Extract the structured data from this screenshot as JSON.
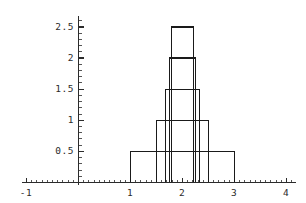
{
  "figure": {
    "background_color": "#ffffff",
    "line_color": "#1a1a1a",
    "axis_color": "#2b2b2b",
    "width": 306,
    "height": 203
  },
  "axes": {
    "x_axis_name": "x-axis",
    "y_axis_name": "y-axis",
    "x_tick_labels": [
      "-1",
      "1",
      "2",
      "3",
      "4"
    ],
    "y_tick_labels": [
      "0.5",
      "1",
      "1.5",
      "2",
      "2.5"
    ]
  },
  "chart_data": {
    "type": "bar",
    "title": "",
    "subtitle": "",
    "xlabel": "",
    "ylabel": "",
    "xlim": [
      -1.1,
      4.15
    ],
    "ylim": [
      0,
      2.62
    ],
    "grid": false,
    "legend": null,
    "legend_position": "none",
    "x_ticks": [
      -1,
      0,
      1,
      2,
      3,
      4
    ],
    "x_tick_labels": [
      "-1",
      "",
      "1",
      "2",
      "3",
      "4"
    ],
    "x_minor_tick_step": 0.1,
    "y_ticks": [
      0.5,
      1,
      1.5,
      2,
      2.5
    ],
    "y_tick_labels": [
      "0.5",
      "1",
      "1.5",
      "2",
      "2.5"
    ],
    "y_minor_tick_step": 0.1,
    "categories": [
      "bin-1",
      "bin-2",
      "bin-3",
      "bin-4",
      "bin-5"
    ],
    "values": [
      0.5,
      1.0,
      1.5,
      2.0,
      2.5
    ],
    "bars": [
      {
        "name": "bin-1",
        "x_left": 1.0,
        "x_right": 3.0,
        "height": 0.5,
        "width": 2.0,
        "center": 2.0
      },
      {
        "name": "bin-2",
        "x_left": 1.5,
        "x_right": 2.5,
        "height": 1.0,
        "width": 1.0,
        "center": 2.0
      },
      {
        "name": "bin-3",
        "x_left": 1.67,
        "x_right": 2.33,
        "height": 1.5,
        "width": 0.66,
        "center": 2.0
      },
      {
        "name": "bin-4",
        "x_left": 1.75,
        "x_right": 2.25,
        "height": 2.0,
        "width": 0.5,
        "center": 2.0
      },
      {
        "name": "bin-5",
        "x_left": 1.79,
        "x_right": 2.21,
        "height": 2.5,
        "width": 0.42,
        "center": 2.0
      }
    ]
  },
  "geometry": {
    "x_origin_px": 78,
    "y_origin_px": 182,
    "px_per_x_unit": 52,
    "px_per_y_unit": 62.2,
    "x_axis_start_px": 22,
    "x_axis_end_px": 296,
    "y_axis_top_px": 16
  }
}
